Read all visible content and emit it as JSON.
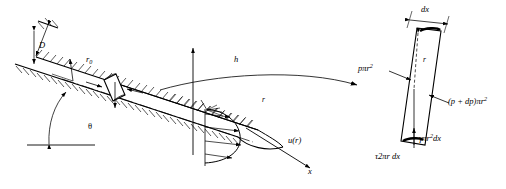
{
  "figure": {
    "stroke_color": "#000000",
    "background_color": "#ffffff"
  },
  "pipe_diagram": {
    "name": "inclined-circular-pipe",
    "labels": {
      "diameter": "D",
      "radius_wall": "r",
      "radius_wall_sub": "0",
      "angle": "θ",
      "height_axis": "h",
      "flow_axis": "x",
      "radial_coordinate": "r",
      "velocity_profile": "u(r)"
    }
  },
  "element_diagram": {
    "name": "fluid-element-free-body",
    "labels": {
      "length": "dx",
      "radius": "r",
      "pressure_upstream_p": "p",
      "pressure_upstream_area": "πr",
      "pressure_upstream_exp": "2",
      "pressure_downstream": "(p + dp)πr",
      "pressure_downstream_exp": "2",
      "weight_gamma": "γπr",
      "weight_exp": "2",
      "weight_dx": "dx",
      "shear": "τ2πr dx"
    }
  }
}
